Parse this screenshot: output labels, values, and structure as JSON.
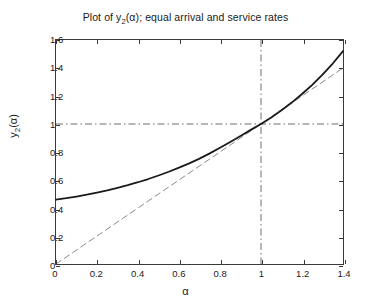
{
  "chart_data": {
    "type": "line",
    "title_parts": {
      "prefix": "Plot of y",
      "subscript": "2",
      "suffix": "(α); equal arrival and service rates"
    },
    "xlabel": "α",
    "ylabel_parts": {
      "prefix": "y",
      "subscript": "2",
      "suffix": "(α)"
    },
    "ylabel": "y_2(alpha)",
    "xlim": [
      0,
      1.4
    ],
    "ylim": [
      0,
      1.6
    ],
    "xticks": [
      0,
      0.2,
      0.4,
      0.6,
      0.8,
      1,
      1.2,
      1.4
    ],
    "xticklabels": [
      "0",
      "0.2",
      "0.4",
      "0.6",
      "0.8",
      "1",
      "1.2",
      "1.4"
    ],
    "yticks": [
      0,
      0.2,
      0.4,
      0.6,
      0.8,
      1,
      1.2,
      1.4,
      1.6
    ],
    "yticklabels": [
      "0",
      "0.2",
      "0.4",
      "0.6",
      "0.8",
      "1",
      "1.2",
      "1.4",
      "1.6"
    ],
    "grid": false,
    "legend": null,
    "series": [
      {
        "name": "y_2(alpha)",
        "style": "solid",
        "color": "#1a1a1a",
        "width": 1.8,
        "x": [
          0.0,
          0.05,
          0.1,
          0.15,
          0.2,
          0.25,
          0.3,
          0.35,
          0.4,
          0.45,
          0.5,
          0.55,
          0.6,
          0.65,
          0.7,
          0.75,
          0.8,
          0.85,
          0.9,
          0.95,
          1.0,
          1.05,
          1.1,
          1.15,
          1.2,
          1.25,
          1.3,
          1.35,
          1.4
        ],
        "y": [
          0.46,
          0.47,
          0.482,
          0.495,
          0.51,
          0.526,
          0.544,
          0.563,
          0.584,
          0.607,
          0.632,
          0.659,
          0.688,
          0.719,
          0.753,
          0.79,
          0.83,
          0.872,
          0.915,
          0.958,
          1.0,
          1.047,
          1.098,
          1.153,
          1.214,
          1.28,
          1.352,
          1.432,
          1.52
        ]
      },
      {
        "name": "y = alpha",
        "style": "dashed",
        "color": "#8a8a8a",
        "width": 1.0,
        "x": [
          0,
          1.4
        ],
        "y": [
          0,
          1.4
        ]
      }
    ],
    "reference_lines": [
      {
        "name": "vertical-reference",
        "orientation": "vertical",
        "value": 1,
        "style": "dashdot",
        "color": "#6e6e6e"
      },
      {
        "name": "horizontal-reference",
        "orientation": "horizontal",
        "value": 1,
        "style": "dashdot",
        "color": "#6e6e6e"
      }
    ],
    "annotations": [
      {
        "name": "crossing-point",
        "x": 1,
        "y": 1,
        "text": ""
      }
    ]
  },
  "colors": {
    "background": "#ffffff",
    "axis": "#3a3a3a",
    "curve": "#1a1a1a",
    "identity_line": "#8a8a8a",
    "reference_line": "#6e6e6e",
    "text": "#1a1a1a"
  }
}
